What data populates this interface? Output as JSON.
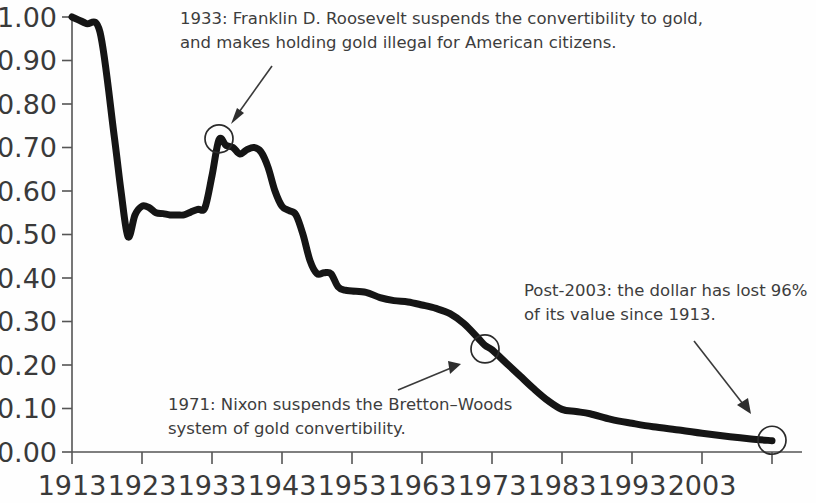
{
  "chart_data": {
    "type": "line",
    "title": "",
    "subtitle": "",
    "xlabel": "",
    "ylabel": "",
    "xlim": [
      1913,
      2013
    ],
    "ylim": [
      0.0,
      1.0
    ],
    "grid": false,
    "legend": "none",
    "x_tick_labels": [
      "1913",
      "1923",
      "1933",
      "1943",
      "1953",
      "1963",
      "1973",
      "1983",
      "1993",
      "2003"
    ],
    "x_tick_values": [
      1913,
      1923,
      1933,
      1943,
      1953,
      1963,
      1973,
      1983,
      1993,
      2003
    ],
    "y_tick_labels": [
      "1.00",
      "0.90",
      "0.80",
      "0.70",
      "0.60",
      "0.50",
      "0.40",
      "0.30",
      "0.20",
      "0.10",
      "0.00"
    ],
    "y_tick_values": [
      1.0,
      0.9,
      0.8,
      0.7,
      0.6,
      0.5,
      0.4,
      0.3,
      0.2,
      0.1,
      0.0
    ],
    "series": [
      {
        "name": "Purchasing power of the U.S. dollar",
        "x": [
          1913,
          1915,
          1917,
          1919,
          1920,
          1921,
          1922,
          1923,
          1924,
          1925,
          1926,
          1927,
          1928,
          1929,
          1930,
          1931,
          1932,
          1933,
          1934,
          1935,
          1936,
          1937,
          1938,
          1939,
          1940,
          1941,
          1942,
          1943,
          1944,
          1945,
          1946,
          1947,
          1948,
          1949,
          1950,
          1951,
          1952,
          1953,
          1955,
          1957,
          1959,
          1961,
          1963,
          1965,
          1967,
          1969,
          1971,
          1972,
          1973,
          1975,
          1977,
          1979,
          1981,
          1983,
          1985,
          1987,
          1990,
          1993,
          1996,
          2000,
          2003,
          2007,
          2010,
          2013
        ],
        "y": [
          1.0,
          0.985,
          0.965,
          0.73,
          0.6,
          0.495,
          0.545,
          0.565,
          0.562,
          0.55,
          0.548,
          0.545,
          0.545,
          0.545,
          0.552,
          0.558,
          0.562,
          0.635,
          0.718,
          0.705,
          0.7,
          0.685,
          0.695,
          0.7,
          0.69,
          0.655,
          0.6,
          0.565,
          0.555,
          0.545,
          0.5,
          0.44,
          0.41,
          0.412,
          0.41,
          0.38,
          0.372,
          0.37,
          0.367,
          0.355,
          0.348,
          0.345,
          0.338,
          0.33,
          0.318,
          0.295,
          0.262,
          0.245,
          0.235,
          0.205,
          0.175,
          0.145,
          0.118,
          0.098,
          0.093,
          0.088,
          0.075,
          0.066,
          0.058,
          0.05,
          0.043,
          0.035,
          0.03,
          0.026
        ]
      }
    ],
    "markers": [
      {
        "name": "marker-1933",
        "x": 1934,
        "y": 0.72,
        "label": "1933"
      },
      {
        "name": "marker-1971",
        "x": 1972,
        "y": 0.237,
        "label": "1971"
      },
      {
        "name": "marker-2013",
        "x": 2013,
        "y": 0.027,
        "label": "Post-2003"
      }
    ],
    "annotations": [
      {
        "name": "annotation-1933",
        "lines": [
          "1933: Franklin D. Roosevelt suspends the convertibility to gold,",
          "and makes holding gold illegal for American citizens."
        ]
      },
      {
        "name": "annotation-1971",
        "lines": [
          "1971: Nixon suspends the Bretton–Woods",
          "system of gold convertibility."
        ]
      },
      {
        "name": "annotation-post-2003",
        "lines": [
          "Post-2003: the dollar has lost 96%",
          "of its value since 1913."
        ]
      }
    ],
    "colors": {
      "line": "#151515",
      "axis": "#555555",
      "text": "#3a3a3a",
      "background": "#fefefe"
    }
  }
}
